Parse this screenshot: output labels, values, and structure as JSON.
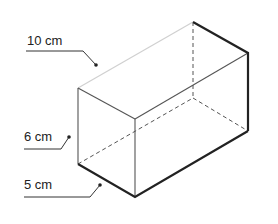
{
  "diagram": {
    "type": "rectangular-prism",
    "labels": {
      "length": "10 cm",
      "height": "6 cm",
      "width": "5 cm"
    },
    "colors": {
      "edge": "#222222",
      "thin_edge": "#555555",
      "hidden_edge": "#555555",
      "faint_edge": "#cccccc",
      "label": "#222222"
    }
  }
}
